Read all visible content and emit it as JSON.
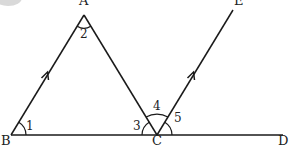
{
  "diagram": {
    "type": "geometry",
    "colors": {
      "stroke": "#1a1a1a",
      "text": "#222222",
      "background": "#ffffff"
    },
    "points": {
      "A": {
        "label": "A",
        "x": 84,
        "y": 15
      },
      "B": {
        "label": "B",
        "x": 11,
        "y": 135
      },
      "C": {
        "label": "C",
        "x": 157,
        "y": 135
      },
      "D": {
        "label": "D",
        "x": 283,
        "y": 135
      },
      "E": {
        "label": "E",
        "x": 233,
        "y": 10
      }
    },
    "segments": [
      {
        "from": "B",
        "to": "A",
        "parallel_arrow": true
      },
      {
        "from": "A",
        "to": "C",
        "parallel_arrow": false
      },
      {
        "from": "B",
        "to": "D",
        "parallel_arrow": false
      },
      {
        "from": "C",
        "to": "E",
        "parallel_arrow": true
      }
    ],
    "angles": [
      {
        "label": "1",
        "vertex": "B",
        "between": [
          "A",
          "C"
        ]
      },
      {
        "label": "2",
        "vertex": "A",
        "between": [
          "B",
          "C"
        ]
      },
      {
        "label": "3",
        "vertex": "C",
        "between": [
          "A",
          "B"
        ]
      },
      {
        "label": "4",
        "vertex": "C",
        "between": [
          "A",
          "E"
        ]
      },
      {
        "label": "5",
        "vertex": "C",
        "between": [
          "E",
          "D"
        ]
      }
    ]
  }
}
